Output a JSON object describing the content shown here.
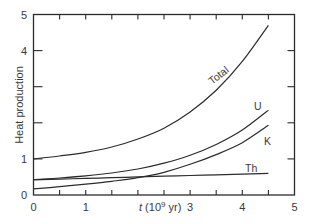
{
  "chart_data": {
    "type": "line",
    "title": "",
    "xlabel": "t (10⁹ yr)",
    "ylabel": "Heat production",
    "xlim": [
      0,
      5
    ],
    "ylim": [
      0,
      5
    ],
    "x_ticks": [
      "0",
      "1",
      "",
      "3",
      "4",
      "5"
    ],
    "y_ticks": [
      "0",
      "1",
      "",
      "",
      "4",
      "5"
    ],
    "grid": false,
    "legend": "inline curve labels",
    "x": [
      0,
      0.5,
      1,
      1.5,
      2,
      2.5,
      3,
      3.5,
      4,
      4.5
    ],
    "series": [
      {
        "name": "Total",
        "values": [
          1.0,
          1.08,
          1.18,
          1.33,
          1.55,
          1.85,
          2.3,
          2.9,
          3.7,
          4.7
        ]
      },
      {
        "name": "U",
        "values": [
          0.43,
          0.47,
          0.53,
          0.61,
          0.72,
          0.88,
          1.1,
          1.4,
          1.8,
          2.35
        ]
      },
      {
        "name": "K",
        "values": [
          0.17,
          0.23,
          0.3,
          0.38,
          0.48,
          0.63,
          0.85,
          1.12,
          1.45,
          1.93
        ]
      },
      {
        "name": "Th",
        "values": [
          0.42,
          0.44,
          0.46,
          0.48,
          0.5,
          0.52,
          0.54,
          0.56,
          0.58,
          0.6
        ]
      }
    ],
    "annotations": [
      "Total",
      "U",
      "K",
      "Th"
    ]
  },
  "axes": {
    "x_label_italic": "t",
    "x_label_rest": " (10",
    "x_label_sup": "9",
    "x_label_end": " yr)",
    "y_label": "Heat production",
    "x_tick_labels": [
      {
        "v": 0,
        "text": "0"
      },
      {
        "v": 1,
        "text": "1"
      },
      {
        "v": 3,
        "text": "3"
      },
      {
        "v": 4,
        "text": "4"
      },
      {
        "v": 5,
        "text": "5"
      }
    ],
    "y_tick_labels": [
      {
        "v": 0,
        "text": "0"
      },
      {
        "v": 1,
        "text": "1"
      },
      {
        "v": 4,
        "text": "4"
      },
      {
        "v": 5,
        "text": "5"
      }
    ]
  },
  "labels": {
    "total": "Total",
    "u": "U",
    "k": "K",
    "th": "Th"
  },
  "colors": {
    "line": "#2b2b2b",
    "axis": "#2b2b2b",
    "text": "#3a3a3a"
  }
}
